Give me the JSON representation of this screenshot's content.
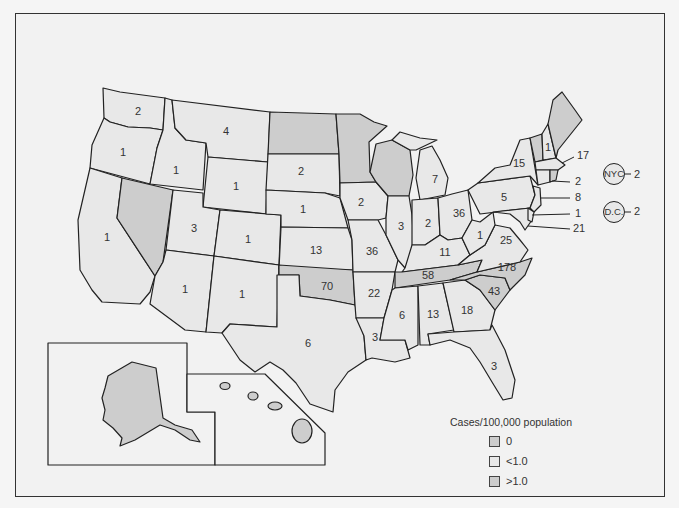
{
  "legend": {
    "title": "Cases/100,000 population",
    "items": [
      {
        "label": "0",
        "color": "#cdcdcd"
      },
      {
        "label": "<1.0",
        "color": "#e8e8e8"
      },
      {
        "label": ">1.0",
        "color": "#cdcdcd"
      }
    ]
  },
  "colors": {
    "zero": "#cdcdcd",
    "low": "#e8e8e8",
    "high": "#cdcdcd",
    "border": "#222222",
    "background": "#f2f2f2"
  },
  "states": {
    "WA": "2",
    "OR": "1",
    "CA": "1",
    "ID": "1",
    "NV": "",
    "MT": "4",
    "WY": "1",
    "UT": "3",
    "AZ": "1",
    "CO": "1",
    "NM": "1",
    "ND": "",
    "SD": "2",
    "NE": "1",
    "KS": "13",
    "OK": "70",
    "TX": "6",
    "MN": "",
    "IA": "2",
    "MO": "36",
    "AR": "22",
    "LA": "3",
    "WI": "",
    "IL": "3",
    "MI": "7",
    "IN": "2",
    "OH": "36",
    "KY": "11",
    "TN": "58",
    "MS": "6",
    "AL": "13",
    "GA": "18",
    "FL": "3",
    "SC": "43",
    "NC": "178",
    "VA": "25",
    "WV": "1",
    "PA": "5",
    "NY": "15",
    "VT": "",
    "NH": "1",
    "ME": "",
    "MA": "17",
    "CT": "2",
    "NJ": "8",
    "DE": "1",
    "MD": "21",
    "AK": "",
    "HI": ""
  },
  "callouts": {
    "MA": "17",
    "CT": "2",
    "NJ": "8",
    "DE": "1",
    "MD": "21"
  },
  "cities": [
    {
      "name": "NYC",
      "value": "2"
    },
    {
      "name": "D.C.",
      "value": "2"
    }
  ]
}
